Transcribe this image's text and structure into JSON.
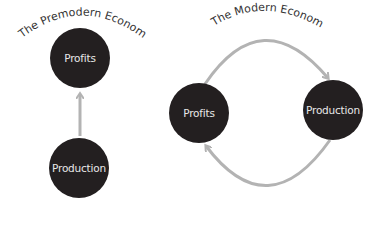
{
  "diagrams": [
    {
      "title": "The Premodern Economy",
      "nodes": [
        {
          "label": "Profits"
        },
        {
          "label": "Production"
        }
      ],
      "edges": [
        {
          "from": "Production",
          "to": "Profits"
        }
      ]
    },
    {
      "title": "The Modern Economy",
      "nodes": [
        {
          "label": "Profits"
        },
        {
          "label": "Production"
        }
      ],
      "edges": [
        {
          "from": "Profits",
          "to": "Production"
        },
        {
          "from": "Production",
          "to": "Profits"
        }
      ]
    }
  ],
  "colors": {
    "node_fill": "#231f20",
    "arrow": "#b3b3b3",
    "title": "#333333",
    "node_text": "#e8e8e8"
  }
}
